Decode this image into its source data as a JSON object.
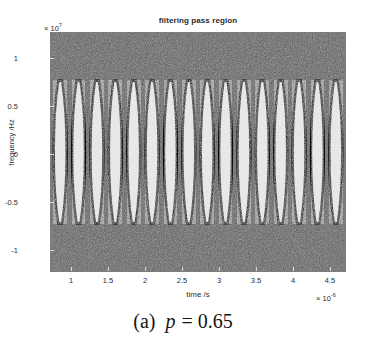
{
  "figure": {
    "title": "filtering pass region",
    "caption_label": "(a)",
    "caption_var": "p",
    "caption_eq": "= 0.65"
  },
  "axes": {
    "y_label": "frequency /Hz",
    "y_exponent_prefix": "× 10",
    "y_exponent": "7",
    "x_label": "time /s",
    "x_exponent_prefix": "× 10",
    "x_exponent": "-6"
  },
  "colors": {
    "background_noise": "#565656",
    "lens_fill": "#e2e2e2",
    "lens_outline": "#0d0d0d",
    "frame": "#7d7d7d",
    "text": "#2b2b2b"
  },
  "chart_data": {
    "type": "heatmap",
    "title": "filtering pass region",
    "xlabel": "time /s",
    "ylabel": "frequency /Hz",
    "xlim": [
      0.72,
      4.72
    ],
    "ylim": [
      -1.25,
      1.25
    ],
    "x_scale_exponent": -6,
    "y_scale_exponent": 7,
    "xticks": [
      1,
      1.5,
      2,
      2.5,
      3,
      3.5,
      4,
      4.5
    ],
    "xticklabels": [
      "1",
      "1.5",
      "2",
      "2.5",
      "3",
      "3.5",
      "4",
      "4.5"
    ],
    "yticks": [
      1,
      0.5,
      0,
      -0.5,
      -1
    ],
    "yticklabels": [
      "1",
      "0.5",
      "0",
      "-0.5",
      "-1"
    ],
    "grid": false,
    "legend": null,
    "n_lenses": 16,
    "lens_half_height_hz": 0.75,
    "lens_period_s": 0.25,
    "lens_first_center_s": 0.845,
    "lens_width_s": 0.175,
    "regions": [
      {
        "name": "pass",
        "fill": "#e2e2e2",
        "value": 1
      },
      {
        "name": "stop",
        "fill": "#565656",
        "value": 0
      }
    ]
  }
}
